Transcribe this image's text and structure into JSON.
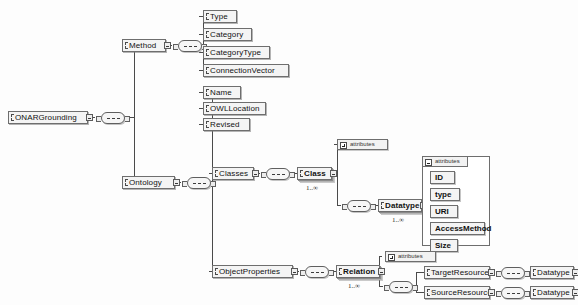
{
  "diagram": {
    "kind": "xml-schema-tree",
    "root": "ONARGrounding"
  },
  "nodes": {
    "root": {
      "label": "ONARGrounding"
    },
    "method": {
      "label": "Method"
    },
    "ontology": {
      "label": "Ontology"
    },
    "type": {
      "label": "Type"
    },
    "category": {
      "label": "Category"
    },
    "category_type": {
      "label": "CategoryType"
    },
    "connection_vector": {
      "label": "ConnectionVector"
    },
    "name": {
      "label": "Name"
    },
    "owl_location": {
      "label": "OWLLocation"
    },
    "revised": {
      "label": "Revised"
    },
    "classes": {
      "label": "Classes"
    },
    "class": {
      "label": "Class",
      "cardinality": "1..∞"
    },
    "datatype": {
      "label": "Datatype",
      "cardinality": "1..∞"
    },
    "object_properties": {
      "label": "ObjectProperties"
    },
    "relation": {
      "label": "Relation",
      "cardinality": "1..∞"
    },
    "target_resource": {
      "label": "TargetResource"
    },
    "source_resource": {
      "label": "SourceResource"
    },
    "target_datatype": {
      "label": "Datatype"
    },
    "source_datatype": {
      "label": "Datatype"
    }
  },
  "attribute_groups": {
    "class_attributes": {
      "label": "attributes",
      "state": "collapsed"
    },
    "relation_attributes": {
      "label": "attributes",
      "state": "collapsed"
    },
    "datatype_attributes": {
      "label": "attributes",
      "state": "expanded",
      "items": [
        {
          "label": "ID"
        },
        {
          "label": "type"
        },
        {
          "label": "URI"
        },
        {
          "label": "AccessMethod"
        },
        {
          "label": "Size"
        }
      ]
    }
  },
  "compositors": {
    "root_sequence": {
      "kind": "sequence"
    },
    "method_sequence": {
      "kind": "sequence"
    },
    "ontology_sequence": {
      "kind": "sequence"
    },
    "classes_sequence": {
      "kind": "sequence"
    },
    "class_sequence": {
      "kind": "sequence"
    },
    "object_properties_sequence": {
      "kind": "sequence"
    },
    "relation_sequence": {
      "kind": "sequence"
    },
    "target_resource_sequence": {
      "kind": "sequence"
    },
    "source_resource_sequence": {
      "kind": "sequence"
    }
  },
  "colors": {
    "node_fill": "#f4f4f4",
    "node_border": "#6e6e6e",
    "line": "#4a4a4a",
    "background": "#fdfdfd"
  }
}
